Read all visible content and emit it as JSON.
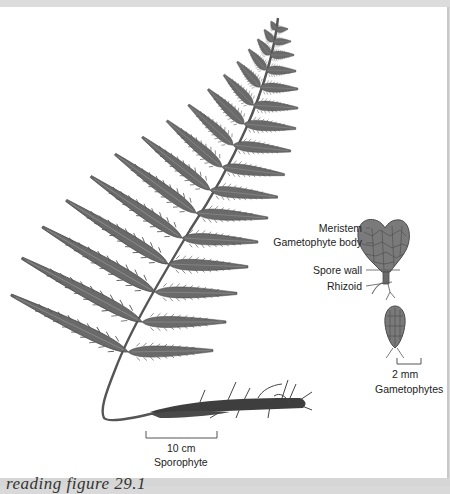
{
  "figure": {
    "caption": "reading figure 29.1",
    "sporophyte": {
      "scale_bar": "10 cm",
      "label": "Sporophyte"
    },
    "gametophyte": {
      "labels": {
        "meristem": "Meristem",
        "gametophyte_body": "Gametophyte body",
        "spore_wall": "Spore wall",
        "rhizoid": "Rhizoid"
      },
      "scale_bar": "2 mm",
      "label": "Gametophytes"
    },
    "colors": {
      "frond": "#6e6e6e",
      "frond_dark": "#4a4a4a",
      "background": "#ffffff",
      "frame": "#d9d9d9"
    }
  }
}
